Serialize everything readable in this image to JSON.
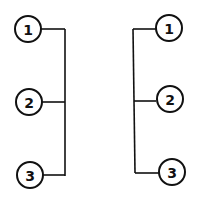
{
  "diagram": {
    "colors": {
      "stroke": "#111111",
      "background": "#ffffff"
    },
    "left_group": {
      "bus_side": "right",
      "nodes": [
        {
          "label": "1"
        },
        {
          "label": "2"
        },
        {
          "label": "3"
        }
      ]
    },
    "right_group": {
      "bus_side": "left",
      "nodes": [
        {
          "label": "1"
        },
        {
          "label": "2"
        },
        {
          "label": "3"
        }
      ]
    }
  }
}
